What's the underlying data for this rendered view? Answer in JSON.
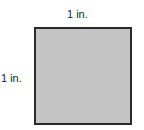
{
  "diagram": {
    "shape": "square",
    "fill_color": "#c4c4c4",
    "border_color": "#2a2a2a",
    "top_side_label": "1 in.",
    "left_side_label": "1 in."
  }
}
